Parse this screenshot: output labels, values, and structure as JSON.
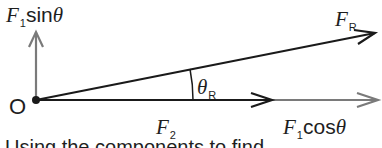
{
  "diagram": {
    "colors": {
      "black_vector": "#1a1a1a",
      "gray_vector": "#7a7a7a",
      "text": "#1e1e1e"
    },
    "origin": {
      "label": "O"
    },
    "vectors": [
      {
        "id": "F1sin",
        "symbol": "F",
        "subscript": "1",
        "fn": "sin",
        "angle": "θ",
        "color": "gray",
        "direction": "up"
      },
      {
        "id": "FR",
        "symbol": "F",
        "subscript": "R",
        "color": "black",
        "direction": "up-right"
      },
      {
        "id": "F2",
        "symbol": "F",
        "subscript": "2",
        "color": "black",
        "direction": "right"
      },
      {
        "id": "F1cos",
        "symbol": "F",
        "subscript": "1",
        "fn": "cos",
        "angle": "θ",
        "color": "gray",
        "direction": "right"
      }
    ],
    "angle_label": {
      "symbol": "θ",
      "subscript": "R"
    },
    "caption": "Using the components to find ..."
  }
}
